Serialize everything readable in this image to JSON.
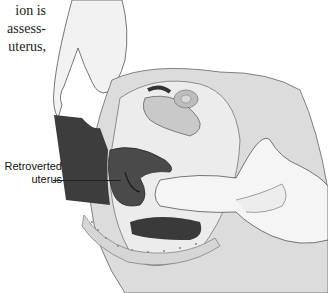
{
  "body_text": {
    "lines": [
      "ion  is",
      "assess-",
      "uterus,"
    ]
  },
  "figure": {
    "label_line1": "Retroverted",
    "label_line2": "uterus",
    "colors": {
      "tissue_light": "#e6e6e6",
      "tissue_mid": "#bdbdbd",
      "tissue_dark": "#3a3a3a",
      "outline": "#555555",
      "glove": "#f4f4f4"
    }
  }
}
